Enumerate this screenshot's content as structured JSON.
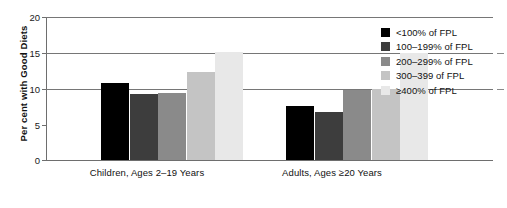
{
  "chart_data": {
    "type": "bar",
    "title": "",
    "xlabel": "",
    "ylabel": "Per cent with Good Diets",
    "ylim": [
      0,
      20
    ],
    "yticks": [
      0,
      5,
      10,
      15,
      20
    ],
    "ytick_labels": [
      "0",
      "5",
      "10",
      "15",
      "20"
    ],
    "grid": true,
    "legend_position": "right",
    "categories": [
      "Children, Ages 2–19 Years",
      "Adults, Ages ≥20 Years"
    ],
    "series": [
      {
        "name": "<100% of FPL",
        "color": "#000000",
        "values": [
          10.8,
          7.6
        ]
      },
      {
        "name": "100–199% of FPL",
        "color": "#3d3d3d",
        "values": [
          9.3,
          6.7
        ]
      },
      {
        "name": "200–299% of FPL",
        "color": "#8a8a8a",
        "values": [
          9.4,
          9.8
        ]
      },
      {
        "name": "300–399 of FPL",
        "color": "#c4c4c4",
        "values": [
          12.3,
          9.9
        ]
      },
      {
        "name": "≥400% of FPL",
        "color": "#e8e8e8",
        "values": [
          15.1,
          15.0
        ]
      }
    ]
  },
  "axis": {
    "y_title": "Per cent with Good Diets",
    "y_tick_0": "0",
    "y_tick_1": "5",
    "y_tick_2": "10",
    "y_tick_3": "15",
    "y_tick_4": "20"
  },
  "categories": {
    "children": "Children, Ages 2–19 Years",
    "adults": "Adults, Ages ≥20 Years"
  },
  "legend": {
    "items": [
      {
        "label": "<100% of FPL",
        "color": "#000000"
      },
      {
        "label": "100–199% of FPL",
        "color": "#3d3d3d"
      },
      {
        "label": "200–299% of FPL",
        "color": "#8a8a8a"
      },
      {
        "label": "300–399 of FPL",
        "color": "#c4c4c4"
      },
      {
        "label": "≥400% of FPL",
        "color": "#e8e8e8"
      }
    ]
  }
}
